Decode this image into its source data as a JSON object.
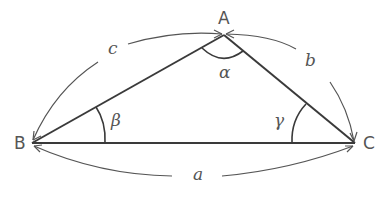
{
  "diagram": {
    "type": "triangle",
    "vertices": {
      "A": "A",
      "B": "B",
      "C": "C"
    },
    "sides": {
      "a": "a",
      "b": "b",
      "c": "c"
    },
    "angles": {
      "alpha": "α",
      "beta": "β",
      "gamma": "γ"
    },
    "colors": {
      "stroke": "#3a3a3a",
      "text": "#555555"
    }
  }
}
